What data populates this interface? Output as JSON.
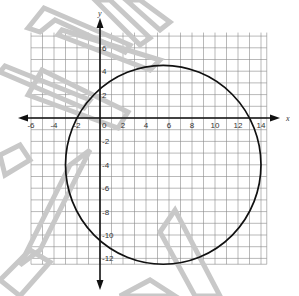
{
  "chart_data": {
    "type": "line",
    "title": "",
    "xlabel": "x",
    "ylabel": "y",
    "xlim": [
      -7,
      15
    ],
    "ylim": [
      -13,
      7
    ],
    "grid": true,
    "x_tick_labels": [
      "-6",
      "-4",
      "-2",
      "0",
      "2",
      "4",
      "6",
      "8",
      "10",
      "12",
      "14"
    ],
    "x_ticks": [
      -6,
      -4,
      -2,
      0,
      2,
      4,
      6,
      8,
      10,
      12,
      14
    ],
    "y_tick_labels": [
      "6",
      "4",
      "2",
      "-2",
      "-4",
      "-6",
      "-8",
      "-10",
      "-12"
    ],
    "y_ticks": [
      6,
      4,
      2,
      -2,
      -4,
      -6,
      -8,
      -10,
      -12
    ],
    "series": [
      {
        "name": "circle",
        "shape": "circle",
        "center": [
          5.5,
          -4
        ],
        "radius": 8.5,
        "color": "#111111"
      }
    ],
    "legend": null
  },
  "colors": {
    "grid": "#8a8a8a",
    "axis": "#111111",
    "curve": "#111111",
    "watermark": "#c8c8c8"
  }
}
